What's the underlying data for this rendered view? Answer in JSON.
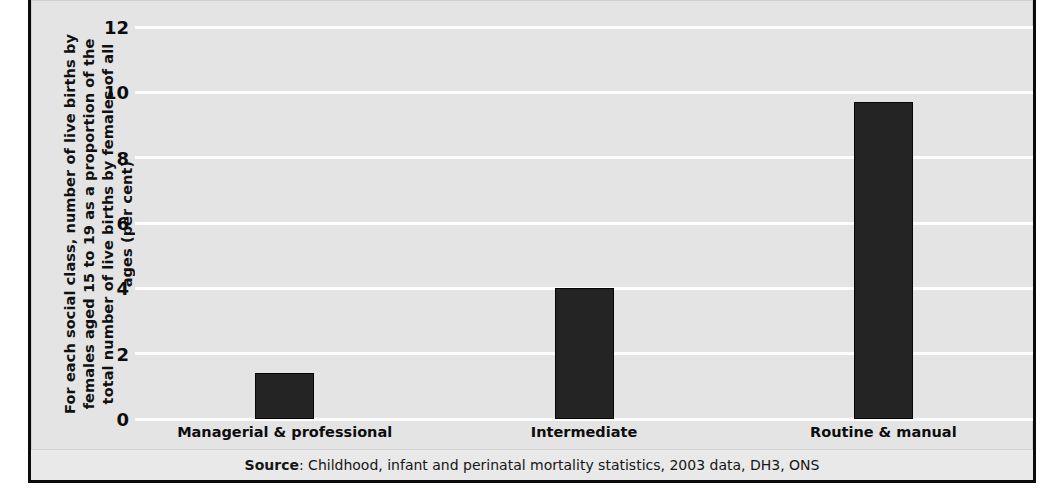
{
  "chart_data": {
    "type": "bar",
    "title": "",
    "subtitle": "",
    "categories": [
      "Managerial & professional",
      "Intermediate",
      "Routine & manual"
    ],
    "values": [
      1.4,
      4.0,
      9.7
    ],
    "series": [
      {
        "name": "Live births to females aged 15 to 19 as a proportion of all live births",
        "values": [
          1.4,
          4.0,
          9.7
        ]
      }
    ],
    "xlabel": "",
    "ylabel": "For each social class, number of live births by females aged 15 to 19 as a proportion of the total number of live births by females of all ages (per cent)",
    "ylim": [
      0,
      12
    ],
    "ytick_labels": [
      "0",
      "2",
      "4",
      "6",
      "8",
      "10",
      "12"
    ],
    "ytick_values": [
      0,
      2,
      4,
      6,
      8,
      10,
      12
    ],
    "grid": true,
    "grid_orientation": "horizontal",
    "legend": false,
    "legend_position": "none",
    "bar_color": "#242424",
    "plot_background": "#e4e4e4",
    "gridline_color": "#fdfdfd"
  },
  "axis": {
    "y_title": "For each social class, number of live births by females aged 15 to 19 as a proportion of the total number of live births by females of all ages (per cent)"
  },
  "source": {
    "label": "Source",
    "separator": ": ",
    "text": "Childhood, infant and perinatal mortality statistics, 2003 data, DH3, ONS"
  }
}
